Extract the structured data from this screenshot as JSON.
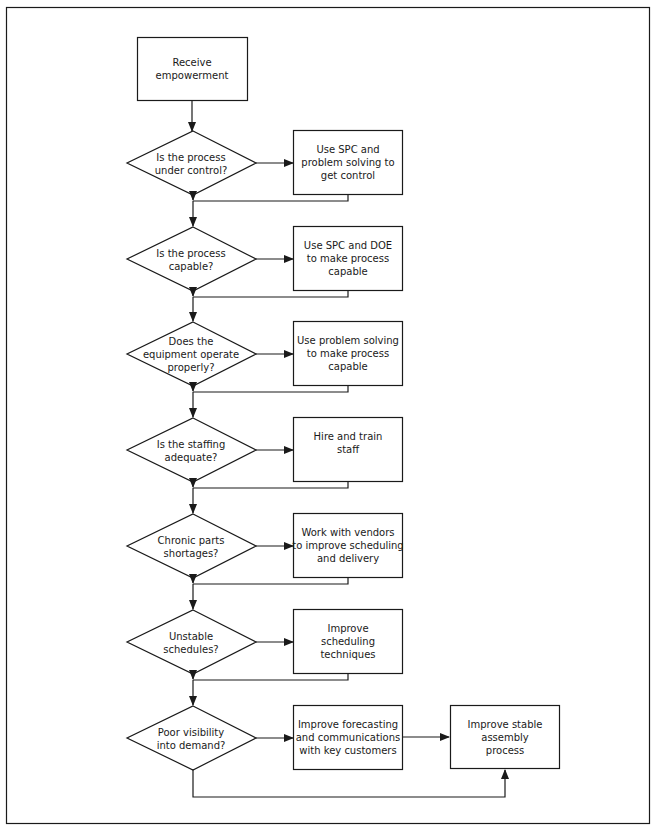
{
  "diagram": {
    "type": "flowchart",
    "colors": {
      "stroke": "#1a1a1a",
      "fill": "#ffffff",
      "text": "#1a1a1a"
    },
    "start": {
      "id": "start",
      "lines": [
        "Receive",
        "empowerment"
      ]
    },
    "decisions": [
      {
        "id": "d1",
        "lines": [
          "Is the process",
          "under control?"
        ]
      },
      {
        "id": "d2",
        "lines": [
          "Is the process",
          "capable?"
        ]
      },
      {
        "id": "d3",
        "lines": [
          "Does the",
          "equipment operate",
          "properly?"
        ]
      },
      {
        "id": "d4",
        "lines": [
          "Is the staffing",
          "adequate?"
        ]
      },
      {
        "id": "d5",
        "lines": [
          "Chronic parts",
          "shortages?"
        ]
      },
      {
        "id": "d6",
        "lines": [
          "Unstable",
          "schedules?"
        ]
      },
      {
        "id": "d7",
        "lines": [
          "Poor visibility",
          "into demand?"
        ]
      }
    ],
    "actions": [
      {
        "id": "a1",
        "lines": [
          "Use SPC and",
          "problem solving to",
          "get control"
        ]
      },
      {
        "id": "a2",
        "lines": [
          "Use SPC and DOE",
          "to make process",
          "capable"
        ]
      },
      {
        "id": "a3",
        "lines": [
          "Use problem solving",
          "to make process",
          "capable"
        ]
      },
      {
        "id": "a4",
        "lines": [
          "Hire and train",
          "staff"
        ]
      },
      {
        "id": "a5",
        "lines": [
          "Work with vendors",
          "to improve scheduling",
          "and delivery"
        ]
      },
      {
        "id": "a6",
        "lines": [
          "Improve",
          "scheduling",
          "techniques"
        ]
      },
      {
        "id": "a7",
        "lines": [
          "Improve forecasting",
          "and communications",
          "with key customers"
        ]
      }
    ],
    "end": {
      "id": "end",
      "lines": [
        "Improve stable",
        "assembly",
        "process"
      ]
    }
  }
}
